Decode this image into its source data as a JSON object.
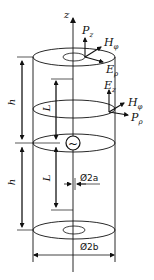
{
  "diagram": {
    "title": "",
    "axis_label": "z",
    "vectors": {
      "p_z": "P",
      "p_z_sub": "z",
      "h_phi_top": "H",
      "h_phi_top_sub": "φ",
      "e_rho": "E",
      "e_rho_sub": "ρ",
      "e_z": "E",
      "e_z_sub": "z",
      "h_phi_side": "H",
      "h_phi_side_sub": "φ",
      "p_rho": "P",
      "p_rho_sub": "ρ"
    },
    "dimensions": {
      "h_upper": "h",
      "h_lower": "h",
      "l_upper": "L",
      "l_lower": "L",
      "inner_diameter": "Ø2a",
      "outer_diameter": "Ø2b"
    },
    "source_symbol": "~",
    "colors": {
      "line": "#111111",
      "background": "#ffffff"
    }
  }
}
